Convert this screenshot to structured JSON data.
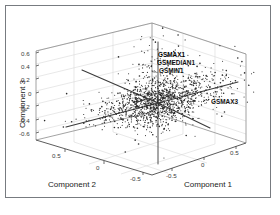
{
  "figure": {
    "type": "3d-biplot",
    "background_color": "#ffffff",
    "border_color": "#777b80"
  },
  "axes": {
    "x": {
      "label": "Component 1",
      "ticks": [
        "-0.5",
        "0",
        "0.5"
      ],
      "range": [
        -0.8,
        0.8
      ]
    },
    "y": {
      "label": "Component 2",
      "ticks": [
        "0.5",
        "0",
        "-0.5"
      ],
      "range": [
        -0.8,
        0.8
      ]
    },
    "z": {
      "label": "Component 3",
      "ticks": [
        "0.6",
        "0.4",
        "0.2",
        "0",
        "-0.2",
        "-0.4",
        "-0.6"
      ],
      "range": [
        -0.7,
        0.7
      ]
    }
  },
  "point_labels": {
    "top_group": [
      "GSMAX1",
      "GSMEDIAN1",
      "GSMIN1"
    ],
    "right_group": [
      "GSMAX3"
    ]
  },
  "chart_data": {
    "type": "scatter",
    "title": "",
    "xlabel": "Component 1",
    "ylabel": "Component 2",
    "zlabel": "Component 3",
    "xlim": [
      -0.8,
      0.8
    ],
    "ylim": [
      -0.8,
      0.8
    ],
    "zlim": [
      -0.7,
      0.7
    ],
    "xticks": [
      -0.5,
      0,
      0.5
    ],
    "yticks": [
      0.5,
      0,
      -0.5
    ],
    "zticks": [
      0.6,
      0.4,
      0.2,
      0,
      -0.2,
      -0.4,
      -0.6
    ],
    "grid": true,
    "legend": "none",
    "marker_color": "#2b2b2b",
    "vector_color": "#3d3d3d",
    "annotations": [
      {
        "text": "GSMAX1",
        "x": 0.02,
        "y": 0.04,
        "z": 0.56
      },
      {
        "text": "GSMEDIAN1",
        "x": 0.02,
        "y": 0.04,
        "z": 0.44
      },
      {
        "text": "GSMIN1",
        "x": 0.02,
        "y": 0.04,
        "z": 0.34
      },
      {
        "text": "GSMAX3",
        "x": 0.72,
        "y": -0.05,
        "z": -0.06
      }
    ],
    "loading_vectors": [
      {
        "name": "v-up",
        "dx": 0,
        "dy": 0,
        "dz": 0.62
      },
      {
        "name": "v-down",
        "dx": 0,
        "dy": 0,
        "dz": -0.62
      },
      {
        "name": "v-upper-left",
        "dx": -0.62,
        "dy": 0.26,
        "dz": 0.18
      },
      {
        "name": "v-lower-left",
        "dx": -0.58,
        "dy": -0.3,
        "dz": -0.22
      },
      {
        "name": "v-right",
        "dx": 0.7,
        "dy": 0.1,
        "dz": 0.1
      },
      {
        "name": "v-lower-right",
        "dx": 0.52,
        "dy": -0.34,
        "dz": -0.26
      }
    ],
    "cluster": {
      "center": [
        0.0,
        0.0,
        0.02
      ],
      "n_points": 1400,
      "spread_x": 0.3,
      "spread_y": 0.12,
      "spread_z": 0.09,
      "description": "dense elongated point cloud centered near origin, extending toward positive Component 1 and upward tail toward Component 3"
    }
  }
}
